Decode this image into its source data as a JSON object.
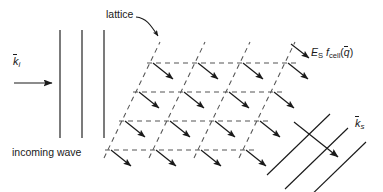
{
  "figure": {
    "background_color": "#ffffff",
    "line_color": "#1a1a1a",
    "dash_color": "#555555",
    "width": 383,
    "height": 192
  },
  "labels": {
    "lattice": "lattice",
    "incoming_wave": "incoming wave",
    "k_incident": "k",
    "k_incident_sub": "i",
    "k_scattered": "k",
    "k_scattered_sub": "s",
    "amplitude_E": "E",
    "amplitude_E_sub": "S",
    "amplitude_f": "f",
    "amplitude_f_sub": "cell",
    "amplitude_arg_open": "(",
    "amplitude_arg": "q",
    "amplitude_arg_close": ")"
  },
  "incoming_wave": {
    "wavefront_count": 3,
    "wavefront_x": [
      60,
      82,
      104
    ],
    "wavefront_top": 30,
    "wavefront_bottom": 138,
    "arrow": {
      "x1": 14,
      "y1": 83,
      "x2": 53,
      "y2": 83,
      "direction": "right"
    }
  },
  "lattice": {
    "rows": 4,
    "cols": 4,
    "row_y": [
      63,
      106,
      149,
      192
    ],
    "row_x_start": [
      153,
      139,
      125,
      111
    ],
    "col_spacing": 45,
    "row_shear_dx": -14,
    "row_spacing": 29,
    "node_arrow": {
      "dx": 22,
      "dy": 17,
      "direction": "down-right"
    },
    "diagonal_direction": "up-right",
    "dash_pattern": "5 4"
  },
  "scattered_wave": {
    "wavefront_count": 3,
    "wavefront_direction": "up-right",
    "arrow": {
      "x1": 294,
      "y1": 123,
      "x2": 339,
      "y2": 158,
      "direction": "down-right"
    }
  }
}
